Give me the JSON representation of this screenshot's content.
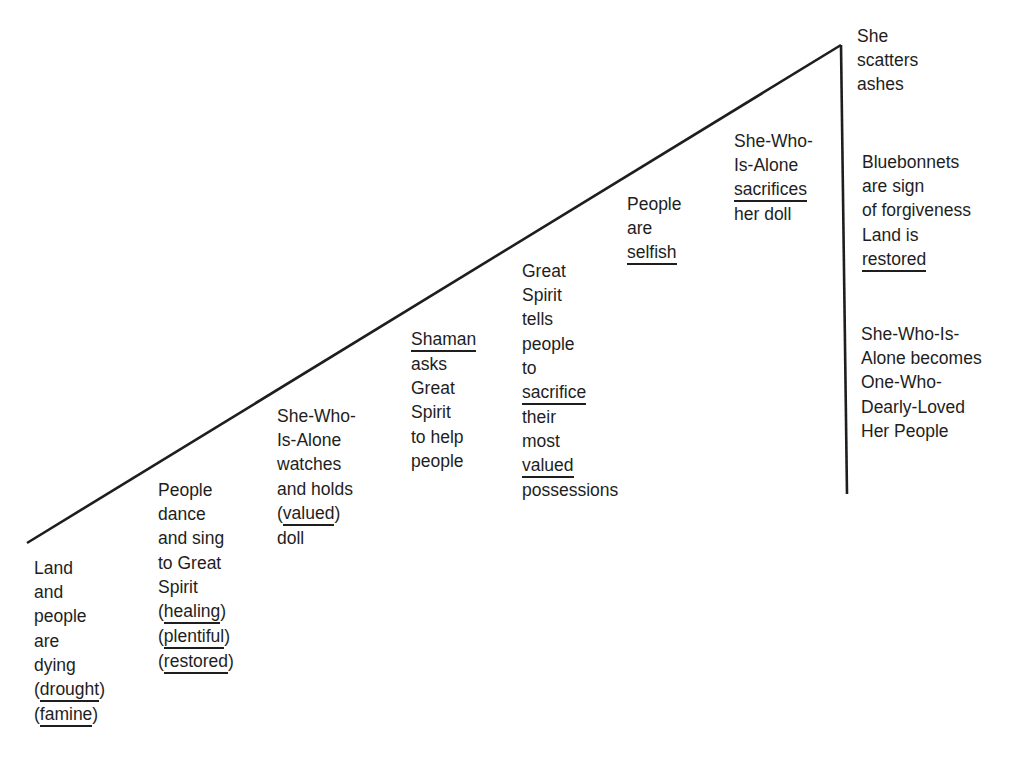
{
  "diagram": {
    "type": "plot-line story map",
    "line_color": "#1e1e1e",
    "events": [
      {
        "id": "e1",
        "lines": [
          "Land",
          "and",
          "people",
          "are",
          "dying",
          "(drought)",
          "(famine)"
        ],
        "underlined": [
          "drought",
          "famine"
        ]
      },
      {
        "id": "e2",
        "lines": [
          "People",
          "dance",
          "and sing",
          "to Great",
          "Spirit",
          "(healing)",
          "(plentiful)",
          "(restored)"
        ],
        "underlined": [
          "healing",
          "plentiful",
          "restored"
        ]
      },
      {
        "id": "e3",
        "lines": [
          "She-Who-",
          "Is-Alone",
          "watches",
          "and holds",
          "(valued)",
          "doll"
        ],
        "underlined": [
          "valued"
        ]
      },
      {
        "id": "e4",
        "lines": [
          "Shaman",
          "asks",
          "Great",
          "Spirit",
          "to help",
          "people"
        ],
        "underlined": [
          "Shaman"
        ]
      },
      {
        "id": "e5",
        "lines": [
          "Great",
          "Spirit",
          "tells",
          "people",
          "to",
          "sacrifice",
          "their",
          "most",
          "valued",
          "possessions"
        ],
        "underlined": [
          "sacrifice",
          "valued"
        ]
      },
      {
        "id": "e6",
        "lines": [
          "People",
          "are",
          "selfish"
        ],
        "underlined": [
          "selfish"
        ]
      },
      {
        "id": "e7",
        "lines": [
          "She-Who-",
          "Is-Alone",
          "sacrifices",
          "her doll"
        ],
        "underlined": [
          "sacrifices"
        ]
      },
      {
        "id": "climax",
        "lines": [
          "She",
          "scatters",
          "ashes"
        ],
        "underlined": []
      },
      {
        "id": "r1",
        "lines": [
          "Bluebonnets",
          "are sign",
          "of forgiveness",
          "Land is",
          "restored"
        ],
        "underlined": [
          "restored"
        ]
      },
      {
        "id": "r2",
        "lines": [
          "She-Who-Is-",
          "Alone becomes",
          "One-Who-",
          "Dearly-Loved",
          "Her People"
        ],
        "underlined": []
      }
    ]
  }
}
